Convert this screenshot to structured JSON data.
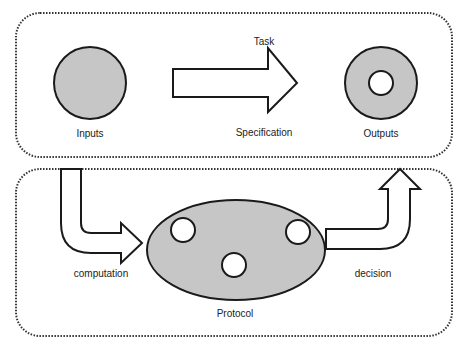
{
  "diagram": {
    "top_panel": {
      "labels": {
        "task": "Task",
        "specification": "Specification",
        "inputs": "Inputs",
        "outputs": "Outputs"
      }
    },
    "bottom_panel": {
      "labels": {
        "computation": "computation",
        "decision": "decision",
        "protocol": "Protocol"
      }
    },
    "colors": {
      "shape_fill": "#c6c6c6",
      "stroke": "#1a1a1a",
      "dotted_border": "#333333",
      "background": "#ffffff"
    }
  }
}
